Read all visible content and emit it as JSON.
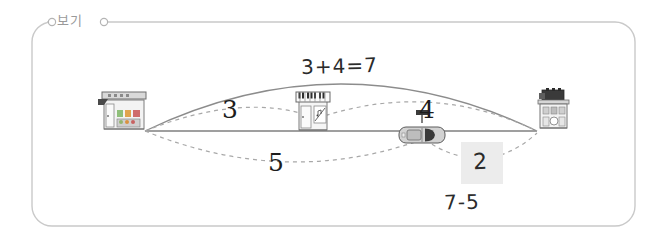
{
  "frame": {
    "label": "보기",
    "border_color": "#c9c9c9",
    "background": "#ffffff"
  },
  "scene": {
    "baseline_color": "#7f7f7f",
    "arc_solid_color": "#8c8c8c",
    "arc_dashed_color": "#a8a8a8",
    "objects": [
      {
        "name": "grocery-store",
        "label": "",
        "position": "left"
      },
      {
        "name": "piano-shop",
        "label": "",
        "position": "middle"
      },
      {
        "name": "car",
        "label": "",
        "position": "right-middle"
      },
      {
        "name": "apartment-building",
        "label": "",
        "position": "right"
      }
    ]
  },
  "labels": {
    "segment_left": "3",
    "segment_right": "4",
    "segment_lower_left": "5",
    "equation_top": "3+4=7",
    "answer": "2",
    "equation_bottom": "7-5"
  },
  "colors": {
    "ink": "#1d1d1d",
    "handwriting": "#2b2b2b",
    "answer_box_fill": "#ececec",
    "label_gray": "#9a9a9a"
  }
}
